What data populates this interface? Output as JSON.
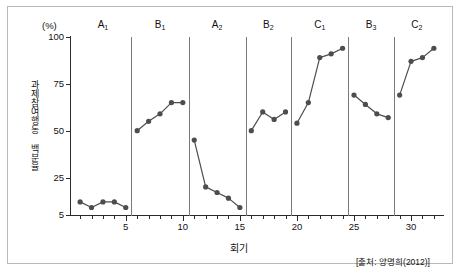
{
  "chart_data": {
    "type": "line",
    "title": "",
    "subtitle": "",
    "xlabel": "회기",
    "ylabel": "과제참여행동 백분율",
    "yunit": "(%)",
    "xlim": [
      0.2,
      32.8
    ],
    "ylim": [
      5,
      100
    ],
    "grid": false,
    "legend": "none",
    "y_ticks": [
      5,
      25,
      50,
      75,
      100
    ],
    "y_tick_labels": [
      "5",
      "25",
      "50",
      "75",
      "100"
    ],
    "x_ticks": [
      5,
      10,
      15,
      20,
      25,
      30
    ],
    "x_tick_labels": [
      "5",
      "10",
      "15",
      "20",
      "25",
      "30"
    ],
    "x_minor_ticks": [
      1,
      2,
      3,
      4,
      6,
      7,
      8,
      9,
      11,
      12,
      13,
      14,
      16,
      17,
      18,
      19,
      21,
      22,
      23,
      24,
      26,
      27,
      28,
      29,
      31,
      32
    ],
    "marker": "filled-circle",
    "marker_color": "#4d4d4d",
    "line_color": "#4d4d4d",
    "phase_dividers_x": [
      5.5,
      10.5,
      15.5,
      19.5,
      24.5,
      28.5
    ],
    "phases": [
      {
        "label": "A1",
        "label_base": "A",
        "label_sub": "1",
        "center_x": 3.0,
        "x": [
          1,
          2,
          3,
          4,
          5
        ],
        "values": [
          12,
          9,
          12,
          12,
          9
        ]
      },
      {
        "label": "B1",
        "label_base": "B",
        "label_sub": "1",
        "center_x": 8.0,
        "x": [
          6,
          7,
          8,
          9,
          10
        ],
        "values": [
          50,
          55,
          59,
          65,
          65
        ]
      },
      {
        "label": "A2",
        "label_base": "A",
        "label_sub": "2",
        "center_x": 13.0,
        "x": [
          11,
          12,
          13,
          14,
          15
        ],
        "values": [
          45,
          20,
          17,
          14,
          9
        ]
      },
      {
        "label": "B2",
        "label_base": "B",
        "label_sub": "2",
        "center_x": 17.5,
        "x": [
          16,
          17,
          18,
          19
        ],
        "values": [
          50,
          60,
          56,
          60
        ]
      },
      {
        "label": "C1",
        "label_base": "C",
        "label_sub": "1",
        "center_x": 22.0,
        "x": [
          20,
          21,
          22,
          23,
          24
        ],
        "values": [
          54,
          65,
          89,
          91,
          94
        ]
      },
      {
        "label": "B3",
        "label_base": "B",
        "label_sub": "3",
        "center_x": 26.5,
        "x": [
          25,
          26,
          27,
          28
        ],
        "values": [
          69,
          64,
          59,
          57
        ]
      },
      {
        "label": "C2",
        "label_base": "C",
        "label_sub": "2",
        "center_x": 30.5,
        "x": [
          29,
          30,
          31,
          32
        ],
        "values": [
          69,
          87,
          89,
          94
        ]
      }
    ]
  },
  "figure": {
    "source_note": "[출처: 양명희(2012)]"
  }
}
